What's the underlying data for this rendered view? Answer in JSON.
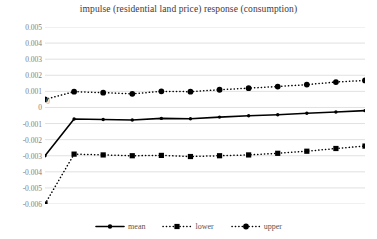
{
  "chart_data": {
    "type": "line",
    "title": "impulse (residential land price)  response (consumption)",
    "xlabel": "",
    "ylabel": "",
    "ylim": [
      -0.006,
      0.005
    ],
    "yticks": [
      0.005,
      0.004,
      0.003,
      0.002,
      0.001,
      0,
      -0.001,
      -0.002,
      -0.003,
      -0.004,
      -0.005,
      -0.006
    ],
    "ytick_labels": [
      "0.005",
      "0.004",
      "0.003",
      "0.002",
      "0.001",
      "0",
      "-0.001",
      "-0.002",
      "-0.003",
      "-0.004",
      "-0.005",
      "-0.006"
    ],
    "origin_label": "0",
    "grid": true,
    "legend_position": "bottom",
    "x": [
      0,
      1,
      2,
      3,
      4,
      5,
      6,
      7,
      8,
      9,
      10,
      11
    ],
    "series": [
      {
        "name": "mean",
        "style": "solid",
        "marker": "circle-small",
        "color": "#000000",
        "values": [
          -0.003,
          -0.00072,
          -0.00075,
          -0.00078,
          -0.00068,
          -0.0007,
          -0.0006,
          -0.00052,
          -0.00045,
          -0.00036,
          -0.00028,
          -0.0002
        ]
      },
      {
        "name": "lower",
        "style": "dotted",
        "marker": "square",
        "color": "#000000",
        "values": [
          -0.006,
          -0.0029,
          -0.00295,
          -0.003,
          -0.00298,
          -0.00305,
          -0.003,
          -0.00295,
          -0.00285,
          -0.00272,
          -0.00255,
          -0.0024
        ]
      },
      {
        "name": "upper",
        "style": "dotted",
        "marker": "circle",
        "color": "#000000",
        "values": [
          0.0005,
          0.00098,
          0.00092,
          0.00085,
          0.001,
          0.00098,
          0.0011,
          0.0012,
          0.0013,
          0.00142,
          0.00158,
          0.00168
        ]
      }
    ]
  },
  "legend": {
    "items": [
      {
        "label": "mean"
      },
      {
        "label": "lower"
      },
      {
        "label": "upper"
      }
    ]
  },
  "colors": {
    "ink": "#000000",
    "grid": "#d9d9d9",
    "tick_text": "#808080",
    "title_text": "#3a3a3a",
    "background": "#ffffff"
  }
}
